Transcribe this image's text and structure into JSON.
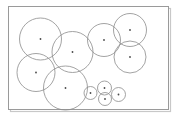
{
  "figure": {
    "background_color": "#ffffff",
    "width": 178,
    "height": 118
  },
  "frame": {
    "label": "bounding-rectangle",
    "x": 8.5,
    "y": 6.5,
    "width": 160,
    "height": 103,
    "stroke_color": "#9a9a9a",
    "stroke_width": 1,
    "fill_color": "#ffffff",
    "shadow_color": "#c8c8c8"
  },
  "chart_data": {
    "type": "scatter",
    "xlabel": "",
    "ylabel": "",
    "xlim": [
      8.5,
      168.5
    ],
    "ylim": [
      6.5,
      109.5
    ],
    "grid": false,
    "legend": "none",
    "style": {
      "circle_stroke_color": "#8c8c8c",
      "circle_stroke_width": 0.8,
      "circle_fill": "none",
      "center_dot_color": "#4a4a4a",
      "center_dot_radius": 0.9
    },
    "annotations": [],
    "circles": [
      {
        "id": "c1",
        "name": "circle-top-left",
        "cx": 40.5,
        "cy": 39.0,
        "r": 21.0
      },
      {
        "id": "c2",
        "name": "circle-upper-middle",
        "cx": 72.5,
        "cy": 52.0,
        "r": 20.5
      },
      {
        "id": "c3",
        "name": "circle-left-lower",
        "cx": 36.0,
        "cy": 72.5,
        "r": 19.0
      },
      {
        "id": "c4",
        "name": "circle-bottom-center",
        "cx": 65.5,
        "cy": 88.0,
        "r": 22.0
      },
      {
        "id": "c5",
        "name": "circle-center-top",
        "cx": 104.0,
        "cy": 40.0,
        "r": 16.5
      },
      {
        "id": "c6",
        "name": "circle-right-upper",
        "cx": 130.0,
        "cy": 30.0,
        "r": 16.5
      },
      {
        "id": "c7",
        "name": "circle-right-lower",
        "cx": 130.0,
        "cy": 57.0,
        "r": 16.0
      },
      {
        "id": "c8",
        "name": "circle-small-left",
        "cx": 90.5,
        "cy": 93.0,
        "r": 6.5
      },
      {
        "id": "c9",
        "name": "circle-small-top",
        "cx": 104.5,
        "cy": 88.0,
        "r": 7.0
      },
      {
        "id": "c10",
        "name": "circle-small-bottom",
        "cx": 105.0,
        "cy": 99.0,
        "r": 6.5
      },
      {
        "id": "c11",
        "name": "circle-small-right",
        "cx": 118.5,
        "cy": 94.5,
        "r": 7.0
      }
    ],
    "centers": {
      "x": [
        40.5,
        72.5,
        36.0,
        65.5,
        104.0,
        130.0,
        130.0,
        90.5,
        104.5,
        105.0,
        118.5
      ],
      "y": [
        39.0,
        52.0,
        72.5,
        88.0,
        40.0,
        30.0,
        57.0,
        93.0,
        88.0,
        99.0,
        94.5
      ],
      "r": [
        21.0,
        20.5,
        19.0,
        22.0,
        16.5,
        16.5,
        16.0,
        6.5,
        7.0,
        6.5,
        7.0
      ]
    },
    "count": 11
  }
}
